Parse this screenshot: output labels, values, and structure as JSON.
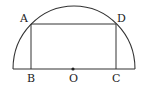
{
  "diagram": {
    "stroke_color": "#333333",
    "labels": {
      "A": "A",
      "B": "B",
      "C": "C",
      "D": "D",
      "O": "O"
    }
  }
}
